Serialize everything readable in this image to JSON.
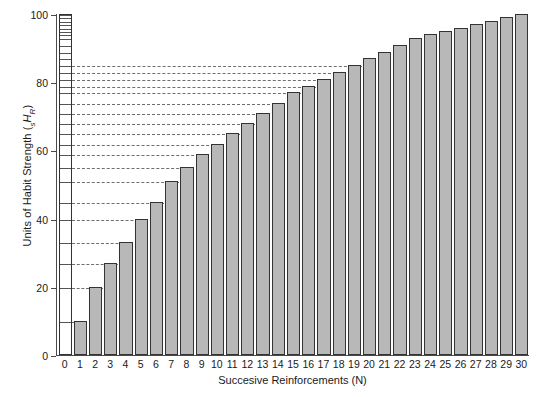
{
  "chart_data": {
    "type": "bar",
    "title": "",
    "subtitle": "",
    "xlabel": "Succesive Reinforcements (N)",
    "ylabel": "Units of Habit Strength (sHR)",
    "ylabel_parts": {
      "main": "Units of Habit Strength (",
      "sub_left": "s",
      "italic_main": "H",
      "sub_right": "R",
      "close": ")"
    },
    "categories": [
      "0",
      "1",
      "2",
      "3",
      "4",
      "5",
      "6",
      "7",
      "8",
      "9",
      "10",
      "11",
      "12",
      "13",
      "14",
      "15",
      "16",
      "17",
      "18",
      "19",
      "20",
      "21",
      "22",
      "23",
      "24",
      "25",
      "26",
      "27",
      "28",
      "29",
      "30"
    ],
    "values": [
      0,
      10,
      20,
      27,
      33,
      40,
      45,
      51,
      55,
      59,
      62,
      65,
      68,
      71,
      74,
      77,
      79,
      81,
      83,
      85,
      87,
      89,
      91,
      93,
      94,
      95,
      96,
      97,
      98,
      99,
      100
    ],
    "xlim": [
      0,
      30
    ],
    "ylim": [
      0,
      100
    ],
    "ytick_values": [
      0,
      20,
      40,
      60,
      80,
      100
    ],
    "ytick_labels": [
      "0",
      "20",
      "40",
      "60",
      "80",
      "100"
    ],
    "xtick_labels": [
      "0",
      "1",
      "2",
      "3",
      "4",
      "5",
      "6",
      "7",
      "8",
      "9",
      "10",
      "11",
      "12",
      "13",
      "14",
      "15",
      "16",
      "17",
      "18",
      "19",
      "20",
      "21",
      "22",
      "23",
      "24",
      "25",
      "26",
      "27",
      "28",
      "29",
      "30"
    ],
    "grid": "horizontal-dashed",
    "gridline_values": [
      10,
      20,
      27,
      33,
      40,
      45,
      51,
      55,
      59,
      62,
      65,
      68,
      71,
      74,
      77,
      79,
      81,
      83,
      85
    ],
    "legend": "none",
    "legend_position": "none",
    "unit_column": {
      "category": "0",
      "description": "white reference column subdivided into 30 increments matching successive bar tops",
      "segment_values": [
        10,
        20,
        27,
        33,
        40,
        45,
        51,
        55,
        59,
        62,
        65,
        68,
        71,
        74,
        77,
        79,
        81,
        83,
        85,
        87,
        89,
        91,
        93,
        94,
        95,
        96,
        97,
        98,
        99,
        100
      ]
    },
    "colors": {
      "bar_fill": "#b8b8b8",
      "bar_edge": "#333333",
      "unit_column_fill": "#ffffff",
      "gridline": "#6e6e6e",
      "axis": "#4a4a4a",
      "text": "#1a1a1a",
      "background": "#ffffff"
    }
  }
}
